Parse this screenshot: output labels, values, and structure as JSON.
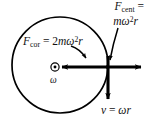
{
  "figure": {
    "type": "physics-diagram",
    "background_color": "#ffffff",
    "stroke_color": "#000000"
  },
  "geometry": {
    "circle": {
      "cx": 60,
      "cy": 65,
      "r": 48,
      "stroke_width": 1.6
    },
    "center_marker": {
      "x": 55,
      "y": 67,
      "outer_r": 4.2,
      "inner_r": 1.5
    },
    "junction": {
      "x": 108,
      "y": 67
    }
  },
  "labels": {
    "centrifugal": {
      "symbol": "F",
      "subscript": "cent",
      "equals": " = ",
      "expression_m": "m",
      "expression_omega": "ω",
      "expression_exp": "2",
      "expression_r": "r",
      "full_text": "F_cent = mω²r"
    },
    "coriolis": {
      "symbol": "F",
      "subscript": "cor",
      "equals": " = ",
      "coefficient": "2",
      "expression_m": "m",
      "expression_omega": "ω",
      "expression_exp": "2",
      "expression_r": "r",
      "full_text": "F_cor = 2mω²r"
    },
    "angular_velocity": {
      "symbol": "ω",
      "full_text": "ω"
    },
    "velocity": {
      "symbol": "v",
      "equals": " = ",
      "expression_omega": "ω",
      "expression_r": "r",
      "full_text": "v = ωr"
    }
  },
  "vectors": {
    "coriolis_arrow": {
      "direction": "left",
      "from_x": 108,
      "to_x": 60,
      "y": 67
    },
    "centrifugal_arrow": {
      "direction": "right",
      "from_x": 108,
      "to_x": 143,
      "y": 67
    },
    "velocity_arrow": {
      "direction": "down",
      "x": 108,
      "from_y": 57,
      "to_y": 101
    },
    "omega_marker": {
      "direction": "out-of-page",
      "glyph": "circle-dot"
    }
  },
  "leaders": {
    "coriolis_leader": {
      "from_x": 73,
      "from_y": 48,
      "to_x": 88,
      "to_y": 61
    },
    "centrifugal_leader": {
      "from_x": 117,
      "from_y": 30,
      "to_x": 110,
      "to_y": 62
    }
  }
}
